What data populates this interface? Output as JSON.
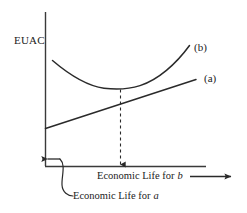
{
  "figure": {
    "type": "economic-life-euac-diagram",
    "background_color": "#ffffff",
    "line_color": "#2a2a2a",
    "axes": {
      "y_axis_label": "EUAC",
      "x_axis_label_primary": "Economic Life for",
      "x_axis_label_primary_var": "b",
      "x_axis_label_secondary": "Economic Life for",
      "x_axis_label_secondary_var": "a"
    },
    "series": [
      {
        "key": "curve_b",
        "label": "(b)",
        "shape": "u-curve",
        "description": "Convex EUAC curve for alternative b with an interior minimum"
      },
      {
        "key": "line_a",
        "label": "(a)",
        "shape": "increasing-line",
        "description": "Monotonically increasing EUAC line for alternative a"
      }
    ],
    "annotations": [
      {
        "key": "min-drop-line",
        "style": "dashed-vertical-arrow",
        "description": "Dashed arrow dropping from the minimum of curve (b) to the horizontal axis"
      },
      {
        "key": "left-arrow",
        "style": "solid-left-arrow",
        "description": "Arrow at the origin indicating the economic life for a is at the left end"
      },
      {
        "key": "leader-curve",
        "style": "curved-leader",
        "description": "Curved leader line connecting the origin arrow to the Economic Life for a caption"
      },
      {
        "key": "right-arrow",
        "style": "solid-right-arrow",
        "description": "Arrow pointing right after the Economic Life for b caption"
      }
    ]
  }
}
